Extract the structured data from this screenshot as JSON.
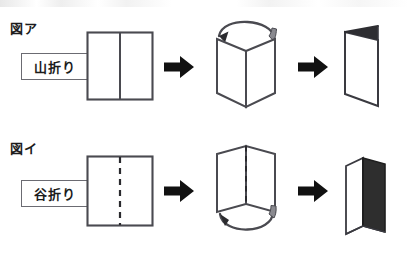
{
  "document": {
    "title": "山折り・谷折り 折り方図解",
    "language": "ja"
  },
  "colors": {
    "ink": "#1c1c1c",
    "line": "#4a4a50",
    "label_border": "#6b6b72",
    "paper": "#ffffff",
    "arrow_fill": "#111111",
    "dark_card": "#2e2e2e",
    "shade": "#7d7d83"
  },
  "rows": [
    {
      "id": "figure-a",
      "heading": "図ア",
      "fold_label": "山折り",
      "fold_type": "mountain",
      "crease_style": "solid",
      "crease_label": "solid-center-line",
      "arc_position": "top",
      "arc_direction": "right-to-left",
      "final_card": "light",
      "steps": [
        {
          "name": "flat-sheet",
          "caption": "山折り"
        },
        {
          "name": "arrow-step-1",
          "caption": "→"
        },
        {
          "name": "folded-3d",
          "caption": ""
        },
        {
          "name": "arrow-step-2",
          "caption": "→"
        },
        {
          "name": "final-card",
          "caption": ""
        }
      ]
    },
    {
      "id": "figure-i",
      "heading": "図イ",
      "fold_label": "谷折り",
      "fold_type": "valley",
      "crease_style": "dashed",
      "crease_label": "dashed-center-line",
      "arc_position": "bottom",
      "arc_direction": "right-to-left",
      "final_card": "dark",
      "steps": [
        {
          "name": "flat-sheet",
          "caption": "谷折り"
        },
        {
          "name": "arrow-step-1",
          "caption": "→"
        },
        {
          "name": "folded-3d",
          "caption": ""
        },
        {
          "name": "arrow-step-2",
          "caption": "→"
        },
        {
          "name": "final-card",
          "caption": ""
        }
      ]
    }
  ],
  "icons": {
    "block_arrow": "block-arrow-right-icon",
    "curved_arrow": "curved-fold-arrow-icon"
  }
}
